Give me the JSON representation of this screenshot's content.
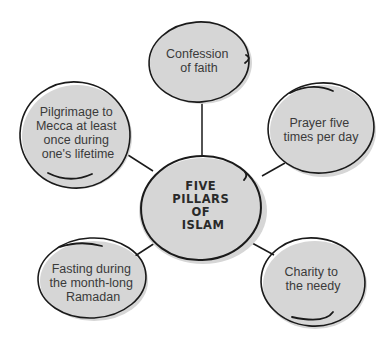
{
  "diagram": {
    "type": "concept-map",
    "center": {
      "id": "five-pillars",
      "lines": [
        "FIVE",
        "PILLARS",
        "OF",
        "ISLAM"
      ]
    },
    "nodes": [
      {
        "id": "confession",
        "lines": [
          "Confession",
          "of faith"
        ]
      },
      {
        "id": "prayer",
        "lines": [
          "Prayer five",
          "times per day"
        ]
      },
      {
        "id": "charity",
        "lines": [
          "Charity to",
          "the needy"
        ]
      },
      {
        "id": "fasting",
        "lines": [
          "Fasting during",
          "the month-long",
          "Ramadan"
        ]
      },
      {
        "id": "pilgrimage",
        "lines": [
          "Pilgrimage to",
          "Mecca at least",
          "once during",
          "one's lifetime"
        ]
      }
    ],
    "colors": {
      "fill": "#d6d6d6",
      "outline": "#1a1a1a",
      "text": "#3a3a3a"
    }
  }
}
